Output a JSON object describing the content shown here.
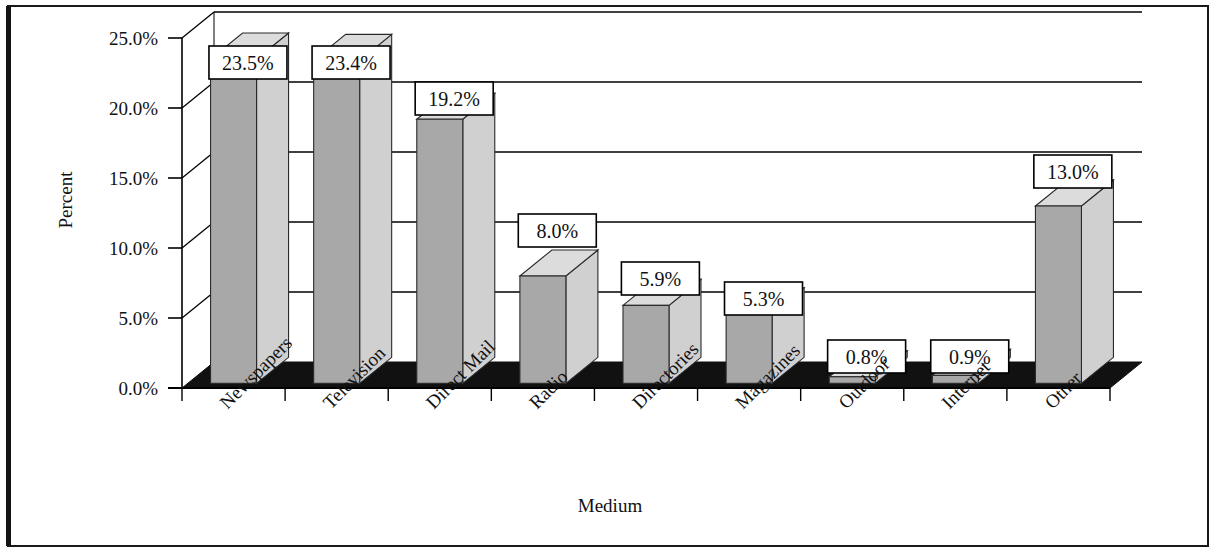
{
  "figure": {
    "border_color": "#000000",
    "background": "#ffffff"
  },
  "chart_data": {
    "type": "bar",
    "title": "",
    "subtitle": "",
    "xlabel": "Medium",
    "ylabel": "Percent",
    "categories": [
      "Newspapers",
      "Television",
      "Direct Mail",
      "Radio",
      "Directories",
      "Magazines",
      "Outdoor",
      "Internet",
      "Other"
    ],
    "values": [
      23.5,
      23.4,
      19.2,
      8.0,
      5.9,
      5.3,
      0.8,
      0.9,
      13.0
    ],
    "data_labels": [
      "23.5%",
      "23.4%",
      "19.2%",
      "8.0%",
      "5.9%",
      "5.3%",
      "0.8%",
      "0.9%",
      "13.0%"
    ],
    "ytick_labels": [
      "0.0%",
      "5.0%",
      "10.0%",
      "15.0%",
      "20.0%",
      "25.0%"
    ],
    "ytick_values": [
      0,
      5,
      10,
      15,
      20,
      25
    ],
    "ylim": [
      0,
      25
    ],
    "grid": true,
    "legend": "none",
    "style": "3d-column",
    "colors": {
      "bar_front": "#a8a8a8",
      "bar_side": "#d0d0d0",
      "bar_top": "#dcdcdc",
      "floor": "#111111",
      "grid_line": "#000000",
      "axis_line": "#000000",
      "label_box_fill": "#ffffff",
      "label_box_border": "#000000",
      "text": "#111111"
    }
  }
}
